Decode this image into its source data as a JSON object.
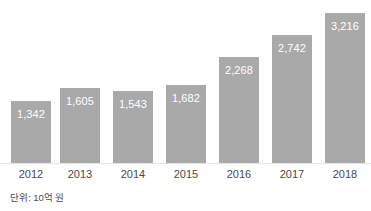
{
  "figure": {
    "title": "",
    "unit_caption": "단위: 10억 원",
    "background_color": "#ffffff"
  },
  "style": {
    "bar_color": "#a9a9a9",
    "value_label_color": "#ffffff",
    "axis_label_color": "#4a4a4a",
    "baseline_color": "#e3e3e3"
  },
  "chart_data": {
    "type": "bar",
    "title": "",
    "xlabel": "",
    "ylabel": "",
    "unit": "단위: 10억 원",
    "grid": false,
    "legend": false,
    "ylim": [
      0,
      3500
    ],
    "categories": [
      "2012",
      "2013",
      "2014",
      "2015",
      "2016",
      "2017",
      "2018"
    ],
    "values": [
      1342,
      1605,
      1543,
      1682,
      2268,
      2742,
      3216
    ],
    "value_labels": [
      "1,342",
      "1,605",
      "1,543",
      "1,682",
      "2,268",
      "2,742",
      "3,216"
    ],
    "bars": [
      {
        "category": "2012",
        "value": 1342,
        "label": "1,342",
        "x": 11,
        "width": 40
      },
      {
        "category": "2013",
        "value": 1605,
        "label": "1,605",
        "x": 60,
        "width": 40
      },
      {
        "category": "2014",
        "value": 1543,
        "label": "1,543",
        "x": 113,
        "width": 40
      },
      {
        "category": "2015",
        "value": 1682,
        "label": "1,682",
        "x": 166,
        "width": 40
      },
      {
        "category": "2016",
        "value": 2268,
        "label": "2,268",
        "x": 219,
        "width": 40
      },
      {
        "category": "2017",
        "value": 2742,
        "label": "2,742",
        "x": 272,
        "width": 40
      },
      {
        "category": "2018",
        "value": 3216,
        "label": "3,216",
        "x": 325,
        "width": 40
      }
    ]
  }
}
